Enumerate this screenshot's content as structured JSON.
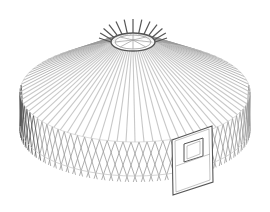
{
  "image": {
    "subject": "Wireframe illustration of a yurt frame",
    "parts": [
      "roof-crown-ring",
      "roof-rafters",
      "lattice-wall",
      "door-frame",
      "door-window"
    ]
  },
  "colors": {
    "background": "#ffffff",
    "line_light": "#c8c8c8",
    "line_mid": "#9a9a9a",
    "line_dark": "#555555"
  }
}
